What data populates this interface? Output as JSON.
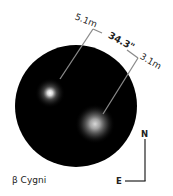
{
  "diagram": {
    "title": "β Cygni",
    "star_a": {
      "magnitude_label": "5.1m"
    },
    "star_b": {
      "magnitude_label": "3.1m"
    },
    "separation_label": "34.3\"",
    "compass": {
      "north_label": "N",
      "east_label": "E"
    },
    "colors": {
      "background": "#ffffff",
      "field": "#000000",
      "line": "#8a8a8a",
      "text": "#222222"
    }
  }
}
